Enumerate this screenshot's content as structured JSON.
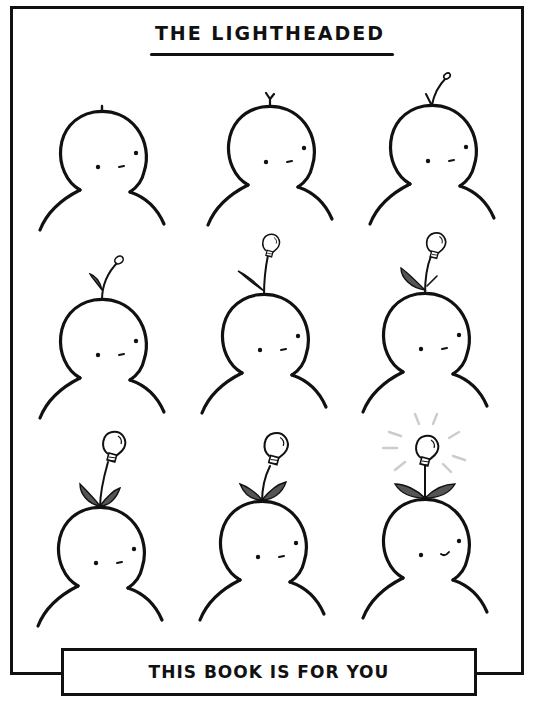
{
  "comic": {
    "title": "THE LIGHTHEADED",
    "caption": "THIS BOOK IS FOR YOU",
    "colors": {
      "ink": "#111111",
      "leaf": "#555555",
      "glow": "#cccccc",
      "paper": "#ffffff"
    },
    "panels": [
      {
        "index": 1,
        "stage": "tiny-sprout-stub",
        "expression": "neutral"
      },
      {
        "index": 2,
        "stage": "y-shaped-sprout",
        "expression": "neutral"
      },
      {
        "index": 3,
        "stage": "sprout-with-bud",
        "expression": "neutral"
      },
      {
        "index": 4,
        "stage": "sprout-with-leaf-and-bud",
        "expression": "neutral"
      },
      {
        "index": 5,
        "stage": "stem-with-small-bulb",
        "expression": "neutral"
      },
      {
        "index": 6,
        "stage": "stem-with-bulb-and-leaf",
        "expression": "neutral"
      },
      {
        "index": 7,
        "stage": "two-leaves-and-bulb",
        "expression": "neutral"
      },
      {
        "index": 8,
        "stage": "two-leaves-and-larger-bulb",
        "expression": "neutral"
      },
      {
        "index": 9,
        "stage": "glowing-bulb",
        "expression": "smile"
      }
    ]
  }
}
